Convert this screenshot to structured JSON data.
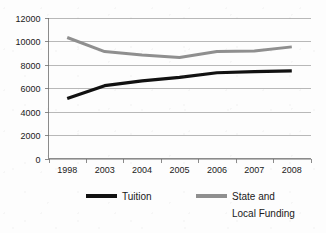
{
  "chart_data": {
    "type": "line",
    "title": "",
    "subtitle": "",
    "xlabel": "",
    "ylabel": "",
    "categories": [
      "1998",
      "2003",
      "2004",
      "2005",
      "2006",
      "2007",
      "2008"
    ],
    "series": [
      {
        "name": "Tuition",
        "color": "#111111",
        "values": [
          5100,
          6200,
          6600,
          6900,
          7300,
          7400,
          7450
        ]
      },
      {
        "name": "State and Local Funding",
        "color": "#8f8f8f",
        "values": [
          10300,
          9100,
          8800,
          8600,
          9100,
          9150,
          9500
        ]
      }
    ],
    "ylim": [
      0,
      12000
    ],
    "yticks": [
      0,
      2000,
      4000,
      6000,
      8000,
      10000,
      12000
    ],
    "ytick_labels": [
      "0",
      "2000",
      "4000",
      "6000",
      "8000",
      "10000",
      "12000"
    ],
    "xtick_labels": [
      "1998",
      "2003",
      "2004",
      "2005",
      "2006",
      "2007",
      "2008"
    ],
    "grid": true,
    "grid_axis": "y",
    "legend_position": "bottom"
  },
  "legend": {
    "entries": [
      {
        "label": "Tuition",
        "label_line2": "",
        "color": "#111111"
      },
      {
        "label": "State and",
        "label_line2": "Local Funding",
        "color": "#8f8f8f"
      }
    ]
  },
  "colors": {
    "background": "#fdfdfd",
    "grid": "#9a9a9a",
    "axis": "#6e6e6e",
    "text": "#1a1a1a",
    "tuition": "#111111",
    "funding": "#8f8f8f"
  }
}
